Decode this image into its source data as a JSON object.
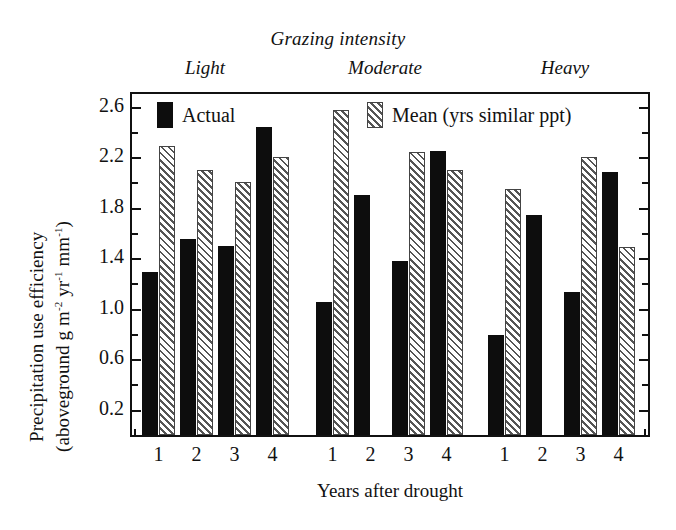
{
  "chart_data": {
    "type": "bar",
    "title": "Grazing intensity",
    "xlabel": "Years after drought",
    "ylabel_line1": "Precipitation use efficiency",
    "ylabel_line2_pre": "(aboveground g  m",
    "ylabel_line2_sup1": "-2",
    "ylabel_line2_mid": " yr",
    "ylabel_line2_sup2": "-1",
    "ylabel_line2_mid2": " mm",
    "ylabel_line2_sup3": "-1",
    "ylabel_line2_post": ")",
    "ylim": [
      0.0,
      2.7
    ],
    "ytick_labels": [
      "2.6",
      "2.2",
      "1.8",
      "1.4",
      "1.0",
      "0.6",
      "0.2"
    ],
    "ytick_values": [
      2.6,
      2.2,
      1.8,
      1.4,
      1.0,
      0.6,
      0.2
    ],
    "yminor_values": [
      2.4,
      2.0,
      1.6,
      1.2,
      0.8,
      0.4
    ],
    "grid": false,
    "legend_position": "inside-top",
    "series": [
      {
        "name": "Actual",
        "key": "actual",
        "color": "#0d0d0d",
        "pattern": "solid"
      },
      {
        "name": "Mean (yrs similar ppt)",
        "key": "mean",
        "color": "#555555",
        "pattern": "diagonal-hatch"
      }
    ],
    "groups": [
      {
        "label": "Light",
        "categories": [
          "1",
          "2",
          "3",
          "4"
        ],
        "actual": [
          1.29,
          1.55,
          1.5,
          2.44
        ],
        "mean": [
          2.29,
          2.1,
          2.0,
          2.2
        ]
      },
      {
        "label": "Moderate",
        "categories": [
          "1",
          "2",
          "3",
          "4"
        ],
        "actual": [
          1.05,
          1.9,
          1.38,
          2.25
        ],
        "mean": [
          2.57,
          null,
          2.24,
          2.1
        ]
      },
      {
        "label": "Heavy",
        "categories": [
          "1",
          "2",
          "3",
          "4"
        ],
        "actual": [
          0.79,
          1.74,
          1.13,
          2.08
        ],
        "mean": [
          1.95,
          null,
          2.2,
          1.49
        ]
      }
    ]
  },
  "legend": {
    "actual_label": "Actual",
    "mean_label": "Mean (yrs similar ppt)"
  },
  "headers": {
    "main": "Grazing intensity",
    "light": "Light",
    "moderate": "Moderate",
    "heavy": "Heavy"
  },
  "axes": {
    "x_title": "Years after drought",
    "y_title_line1": "Precipitation use efficiency"
  }
}
